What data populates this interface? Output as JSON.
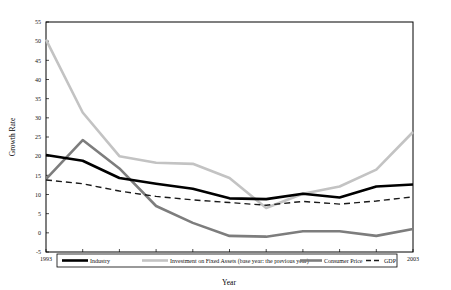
{
  "chart_data": {
    "type": "line",
    "title": "",
    "xlabel": "Year",
    "ylabel": "Growth Rate",
    "x": [
      1993,
      1994,
      1995,
      1996,
      1997,
      1998,
      1999,
      2000,
      2001,
      2002,
      2003
    ],
    "xtick_labels": [
      "1993",
      "1994",
      "1995",
      "1996",
      "1997",
      "1998",
      "1999",
      "2000",
      "2001",
      "2002",
      "2003"
    ],
    "ytick_labels": [
      "-5",
      "0",
      "5",
      "10",
      "15",
      "20",
      "25",
      "30",
      "35",
      "40",
      "45",
      "50",
      "55"
    ],
    "yticks": [
      -5,
      0,
      5,
      10,
      15,
      20,
      25,
      30,
      35,
      40,
      45,
      50,
      55
    ],
    "ylim": [
      -5,
      55
    ],
    "xlim": [
      1993,
      2003
    ],
    "grid": false,
    "legend_position": "below-axes",
    "series": [
      {
        "name": "Industry",
        "color": "#000000",
        "width": 2.6,
        "dash": "none",
        "values": [
          20.3,
          18.8,
          14.3,
          12.8,
          11.5,
          9.0,
          8.8,
          10.2,
          9.2,
          12.1,
          12.6
        ]
      },
      {
        "name": "Investment on Fixed Assets (base year: the previous year)",
        "color": "#c3c3c3",
        "width": 2.6,
        "dash": "none",
        "values": [
          50.4,
          31.4,
          20.0,
          18.3,
          18.0,
          10.2,
          10.5,
          6.4,
          9.0,
          11.0,
          15.0
        ]
      },
      {
        "name": "Consumer Price",
        "color": "#7d7d7d",
        "width": 2.6,
        "dash": "none",
        "values": [
          14.0,
          24.2,
          16.8,
          7.0,
          2.6,
          -0.8,
          -1.0,
          0.4,
          0.4,
          -0.8,
          1.0
        ]
      },
      {
        "name": "GDP",
        "color": "#1a1a1a",
        "width": 1.4,
        "dash": "6,4",
        "values": [
          13.8,
          12.8,
          10.9,
          9.5,
          8.6,
          7.9,
          7.2,
          8.2,
          7.5,
          8.3,
          9.4
        ]
      }
    ],
    "series_alt_values": {
      "Investment on Fixed Assets (base year: the previous year)": [
        50.4,
        31.4,
        20.0,
        18.3,
        18.0,
        14.3,
        6.5,
        10.2,
        12.1,
        16.5,
        26.3
      ]
    }
  },
  "legend": {
    "entries": [
      {
        "label": "Industry",
        "key": "industry"
      },
      {
        "label": "Investment on Fixed Assets (base year: the previous year)",
        "key": "investment-fixed-assets"
      },
      {
        "label": "Consumer Price",
        "key": "consumer-price"
      },
      {
        "label": "GDP",
        "key": "gdp"
      }
    ]
  },
  "axes": {
    "y_title": "Growth Rate",
    "x_title": "Year"
  }
}
